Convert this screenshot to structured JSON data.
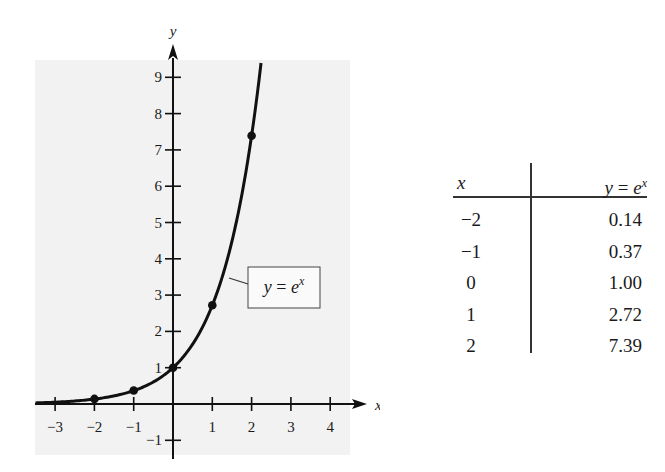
{
  "chart_data": {
    "type": "line",
    "title": "",
    "function": "y = e^x",
    "xlabel": "x",
    "ylabel": "y",
    "xlim": [
      -3.5,
      4.3
    ],
    "ylim": [
      -1.5,
      9.5
    ],
    "x_ticks": [
      -3,
      -2,
      -1,
      1,
      2,
      3,
      4
    ],
    "x_tick_labels": [
      "−3",
      "−2",
      "−1",
      "1",
      "2",
      "3",
      "4"
    ],
    "y_ticks": [
      -1,
      1,
      2,
      3,
      4,
      5,
      6,
      7,
      8,
      9
    ],
    "y_tick_labels": [
      "−1",
      "1",
      "2",
      "3",
      "4",
      "5",
      "6",
      "7",
      "8",
      "9"
    ],
    "grid": false,
    "background": "#f2f2f2",
    "series": [
      {
        "name": "y = e^x",
        "curve_x_range": [
          -3.5,
          2.24
        ],
        "marked_points": {
          "x": [
            -2,
            -1,
            0,
            1,
            2
          ],
          "y": [
            0.14,
            0.37,
            1.0,
            2.72,
            7.39
          ]
        }
      }
    ],
    "annotations": [
      {
        "text": "y = e^x",
        "boxed": true,
        "points_to_x": 1.4
      }
    ]
  },
  "plot": {
    "x_axis_label": "x",
    "y_axis_label": "y",
    "curve_label": {
      "y": "y",
      "eq": "=",
      "base": "e",
      "exp": "x"
    }
  },
  "table": {
    "header_x": "x",
    "header_y": {
      "y": "y",
      "eq": " = ",
      "base": "e",
      "exp": "x"
    },
    "rows": [
      {
        "x": "−2",
        "y": "0.14"
      },
      {
        "x": "−1",
        "y": "0.37"
      },
      {
        "x": "0",
        "y": "1.00"
      },
      {
        "x": "1",
        "y": "2.72"
      },
      {
        "x": "2",
        "y": "7.39"
      }
    ]
  }
}
